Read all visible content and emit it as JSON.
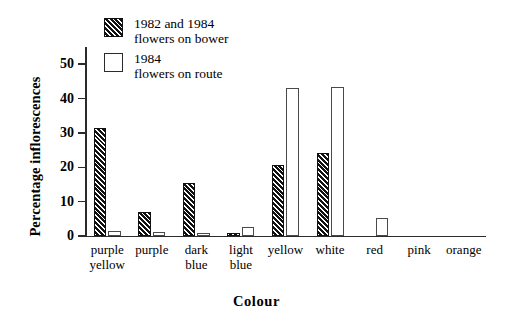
{
  "chart_data": {
    "type": "bar",
    "title": "",
    "xlabel": "Colour",
    "ylabel": "Percentage inflorescences",
    "ylim": [
      0,
      55
    ],
    "yticks": [
      0,
      10,
      20,
      30,
      40,
      50
    ],
    "ytick_labels": [
      "0",
      "10",
      "20",
      "30",
      "40",
      "50"
    ],
    "grid": false,
    "legend_position": "top-left-inside",
    "categories": [
      "purple yellow",
      "purple",
      "dark blue",
      "light blue",
      "yellow",
      "white",
      "red",
      "pink",
      "orange"
    ],
    "category_lines": [
      [
        "purple",
        "yellow"
      ],
      [
        "purple",
        ""
      ],
      [
        "dark",
        "blue"
      ],
      [
        "light",
        "blue"
      ],
      [
        "yellow",
        ""
      ],
      [
        "white",
        ""
      ],
      [
        "red",
        ""
      ],
      [
        "pink",
        ""
      ],
      [
        "orange",
        ""
      ]
    ],
    "series": [
      {
        "name": "1982 and 1984 flowers on bower",
        "legend_lines": [
          "1982 and 1984",
          "flowers on bower"
        ],
        "style": "hatched",
        "values": [
          31.3,
          7.0,
          15.3,
          1.0,
          20.8,
          24.3,
          0,
          0,
          0
        ]
      },
      {
        "name": "1984 flowers on route",
        "legend_lines": [
          "1984",
          "flowers on route"
        ],
        "style": "open",
        "values": [
          1.5,
          1.2,
          1.0,
          2.5,
          43.0,
          43.3,
          5.3,
          0,
          0
        ]
      }
    ]
  }
}
